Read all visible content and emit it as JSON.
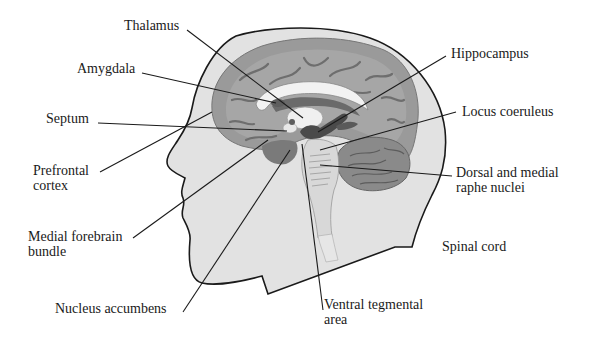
{
  "figure": {
    "type": "sagittal brain section within head silhouette",
    "colors": {
      "background": "#ffffff",
      "head_fill": "#e2e2e2",
      "outline": "#1a1a1a",
      "cortex": "#9a9a9a",
      "cortex_inner": "#b4b4b4",
      "sulci": "#6e6e6e",
      "corpus_callosum": "#f2f2f2",
      "limbic_dark": "#555555",
      "cerebellum": "#8a8a8a",
      "brainstem": "#d8d8d8",
      "leader_line": "#1a1a1a"
    }
  },
  "labels": {
    "thalamus": {
      "lines": [
        "Thalamus"
      ]
    },
    "amygdala": {
      "lines": [
        "Amygdala"
      ]
    },
    "septum": {
      "lines": [
        "Septum"
      ]
    },
    "prefrontal_cortex": {
      "lines": [
        "Prefrontal",
        "cortex"
      ]
    },
    "medial_forebrain_bundle": {
      "lines": [
        "Medial forebrain",
        "bundle"
      ]
    },
    "nucleus_accumbens": {
      "lines": [
        "Nucleus accumbens"
      ]
    },
    "hippocampus": {
      "lines": [
        "Hippocampus"
      ]
    },
    "locus_coeruleus": {
      "lines": [
        "Locus coeruleus"
      ]
    },
    "dorsal_medial_raphe": {
      "lines": [
        "Dorsal and medial",
        "raphe nuclei"
      ]
    },
    "spinal_cord": {
      "lines": [
        "Spinal cord"
      ]
    },
    "ventral_tegmental_area": {
      "lines": [
        "Ventral tegmental",
        "area"
      ]
    }
  }
}
